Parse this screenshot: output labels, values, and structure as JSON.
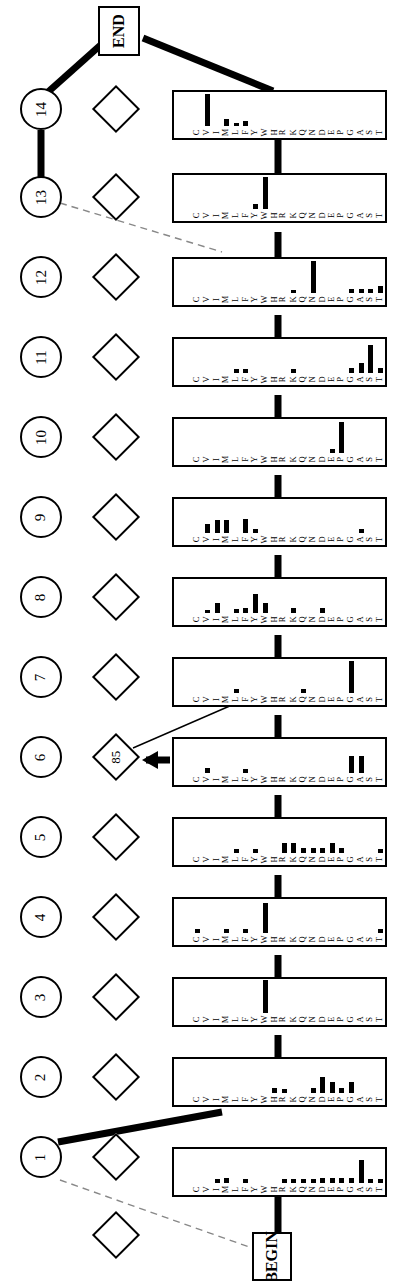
{
  "diagram": {
    "orientation": "rotated-90",
    "ink_color": "#000000",
    "background_color": "#ffffff",
    "terminals": {
      "begin_label": "BEGIN",
      "end_label": "END"
    },
    "state_types": {
      "match_shape": "rectangle",
      "insert_shape": "diamond",
      "delete_shape": "circle"
    },
    "residue_alphabet": [
      "T",
      "S",
      "A",
      "G",
      "P",
      "E",
      "D",
      "N",
      "Q",
      "K",
      "R",
      "H",
      "W",
      "Y",
      "F",
      "L",
      "M",
      "I",
      "V",
      "C"
    ],
    "delete_states": [
      {
        "id": "d14",
        "label": "14"
      },
      {
        "id": "d13",
        "label": "13"
      },
      {
        "id": "d12",
        "label": "12"
      },
      {
        "id": "d11",
        "label": "11"
      },
      {
        "id": "d10",
        "label": "10"
      },
      {
        "id": "d9",
        "label": "9"
      },
      {
        "id": "d8",
        "label": "8"
      },
      {
        "id": "d7",
        "label": "7"
      },
      {
        "id": "d6",
        "label": "6"
      },
      {
        "id": "d5",
        "label": "5"
      },
      {
        "id": "d4",
        "label": "4"
      },
      {
        "id": "d3",
        "label": "3"
      },
      {
        "id": "d2",
        "label": "2"
      },
      {
        "id": "d1",
        "label": "1"
      }
    ],
    "insert_states": [
      {
        "id": "i14",
        "label": ""
      },
      {
        "id": "i13",
        "label": ""
      },
      {
        "id": "i12",
        "label": ""
      },
      {
        "id": "i11",
        "label": ""
      },
      {
        "id": "i10",
        "label": ""
      },
      {
        "id": "i9",
        "label": ""
      },
      {
        "id": "i8",
        "label": ""
      },
      {
        "id": "i7",
        "label": ""
      },
      {
        "id": "i6",
        "label": "85"
      },
      {
        "id": "i5",
        "label": ""
      },
      {
        "id": "i4",
        "label": ""
      },
      {
        "id": "i3",
        "label": ""
      },
      {
        "id": "i2",
        "label": ""
      },
      {
        "id": "i1",
        "label": ""
      },
      {
        "id": "i0",
        "label": ""
      }
    ],
    "annotations": {
      "insert_count_label": "85",
      "arrow_into_insert6": "arrow-left-icon",
      "dashed_edges": 2,
      "solid_edges": 4
    }
  },
  "chart_data": {
    "type": "bar",
    "xlabel": "Amino acid residue",
    "ylabel": "Emission probability",
    "grid": false,
    "legend": "none",
    "categories": [
      "T",
      "S",
      "A",
      "G",
      "P",
      "E",
      "D",
      "N",
      "Q",
      "K",
      "R",
      "H",
      "W",
      "Y",
      "F",
      "L",
      "M",
      "I",
      "V",
      "C"
    ],
    "ylim": [
      0,
      1
    ],
    "series": [
      {
        "name": "Match 14",
        "values": [
          0,
          0,
          0,
          0,
          0,
          0,
          0,
          0,
          0,
          0,
          0,
          0,
          0,
          0,
          0.1,
          0.06,
          0.14,
          0.0,
          0.62,
          0
        ]
      },
      {
        "name": "Match 13",
        "values": [
          0,
          0,
          0,
          0,
          0,
          0,
          0,
          0,
          0,
          0,
          0,
          0,
          0.62,
          0.1,
          0,
          0,
          0,
          0,
          0,
          0
        ]
      },
      {
        "name": "Match 12",
        "values": [
          0.14,
          0.08,
          0.08,
          0.08,
          0,
          0,
          0,
          0.62,
          0,
          0.06,
          0,
          0,
          0,
          0,
          0,
          0,
          0,
          0,
          0,
          0
        ]
      },
      {
        "name": "Match 11",
        "values": [
          0.1,
          0.55,
          0.2,
          0.1,
          0,
          0,
          0,
          0,
          0,
          0.07,
          0,
          0,
          0,
          0,
          0.07,
          0.07,
          0,
          0,
          0,
          0
        ]
      },
      {
        "name": "Match 10",
        "values": [
          0,
          0,
          0,
          0,
          0.6,
          0.07,
          0,
          0,
          0,
          0,
          0,
          0,
          0,
          0,
          0,
          0,
          0,
          0,
          0,
          0
        ]
      },
      {
        "name": "Match 9",
        "values": [
          0,
          0,
          0.08,
          0,
          0,
          0,
          0,
          0,
          0,
          0,
          0,
          0,
          0,
          0.08,
          0.28,
          0,
          0.26,
          0.26,
          0.18,
          0
        ]
      },
      {
        "name": "Match 8",
        "values": [
          0,
          0,
          0,
          0,
          0,
          0,
          0.09,
          0,
          0,
          0.09,
          0,
          0,
          0.2,
          0.38,
          0.1,
          0.07,
          0,
          0.2,
          0.05,
          0
        ]
      },
      {
        "name": "Match 7",
        "values": [
          0,
          0,
          0,
          0.62,
          0,
          0,
          0,
          0,
          0.08,
          0,
          0,
          0,
          0,
          0,
          0,
          0.08,
          0,
          0,
          0,
          0
        ]
      },
      {
        "name": "Match 6",
        "values": [
          0,
          0,
          0.34,
          0.34,
          0,
          0,
          0,
          0,
          0,
          0,
          0,
          0,
          0,
          0,
          0.07,
          0,
          0,
          0,
          0.1,
          0
        ]
      },
      {
        "name": "Match 5",
        "values": [
          0.07,
          0,
          0,
          0,
          0.09,
          0.2,
          0.09,
          0.09,
          0.09,
          0.2,
          0.2,
          0,
          0,
          0.07,
          0,
          0.07,
          0,
          0,
          0,
          0
        ]
      },
      {
        "name": "Match 4",
        "values": [
          0.07,
          0,
          0,
          0,
          0,
          0,
          0,
          0,
          0,
          0,
          0,
          0,
          0.58,
          0,
          0.08,
          0,
          0.08,
          0,
          0,
          0.07
        ]
      },
      {
        "name": "Match 3",
        "values": [
          0,
          0,
          0,
          0,
          0,
          0,
          0,
          0,
          0,
          0,
          0,
          0,
          0.65,
          0,
          0,
          0,
          0,
          0,
          0,
          0
        ]
      },
      {
        "name": "Match 2",
        "values": [
          0,
          0,
          0,
          0.22,
          0.09,
          0.22,
          0.32,
          0.09,
          0,
          0,
          0.08,
          0.09,
          0,
          0,
          0,
          0,
          0,
          0,
          0,
          0
        ]
      },
      {
        "name": "Match 1",
        "values": [
          0.07,
          0.07,
          0.45,
          0.1,
          0.1,
          0.1,
          0.1,
          0.08,
          0.08,
          0.08,
          0.08,
          0,
          0,
          0,
          0.08,
          0,
          0.1,
          0.07,
          0,
          0
        ]
      }
    ]
  }
}
